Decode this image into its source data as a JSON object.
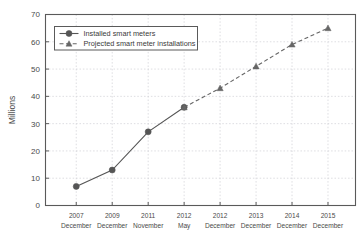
{
  "chart_data": {
    "type": "line",
    "title": "",
    "xlabel": "",
    "ylabel": "Millions",
    "ylim": [
      0,
      70
    ],
    "ytick_step": 10,
    "grid": true,
    "legend_position": "top-left-inside",
    "categories": [
      "2007\nDecember",
      "2009\nDecember",
      "2011\nNovember",
      "2012\nMay",
      "2012\nDecember",
      "2013\nDecember",
      "2014\nDecember",
      "2015\nDecember"
    ],
    "category_lines": [
      [
        "2007",
        "December"
      ],
      [
        "2009",
        "December"
      ],
      [
        "2011",
        "November"
      ],
      [
        "2012",
        "May"
      ],
      [
        "2012",
        "December"
      ],
      [
        "2013",
        "December"
      ],
      [
        "2014",
        "December"
      ],
      [
        "2015",
        "December"
      ]
    ],
    "yticks": [
      0,
      10,
      20,
      30,
      40,
      50,
      60,
      70
    ],
    "series": [
      {
        "name": "Installed smart meters",
        "marker": "circle",
        "line_style": "solid",
        "color": "#555555",
        "x": [
          0,
          1,
          2,
          3
        ],
        "values": [
          7,
          13,
          27,
          36
        ]
      },
      {
        "name": "Projected smart meter installations",
        "marker": "triangle",
        "line_style": "dashed",
        "color": "#666666",
        "x": [
          3,
          4,
          5,
          6,
          7
        ],
        "values": [
          36,
          43,
          51,
          59,
          65
        ]
      }
    ]
  },
  "legend": {
    "items": [
      {
        "label": "Installed smart meters",
        "marker": "circle",
        "line_style": "solid"
      },
      {
        "label": "Projected smart meter installations",
        "marker": "triangle",
        "line_style": "dashed"
      }
    ]
  },
  "axes": {
    "y_axis_label": "Millions",
    "y_tick_labels": [
      "0",
      "10",
      "20",
      "30",
      "40",
      "50",
      "60",
      "70"
    ],
    "x_tick_labels_line1": [
      "2007",
      "2009",
      "2011",
      "2012",
      "2012",
      "2013",
      "2014",
      "2015"
    ],
    "x_tick_labels_line2": [
      "December",
      "December",
      "November",
      "May",
      "December",
      "December",
      "December",
      "December"
    ]
  },
  "colors": {
    "series_installed": "#555555",
    "series_projected": "#666666",
    "grid": "#cfcfd4",
    "frame": "#5a5a5a",
    "text": "#4a4a4a",
    "background": "#ffffff"
  }
}
